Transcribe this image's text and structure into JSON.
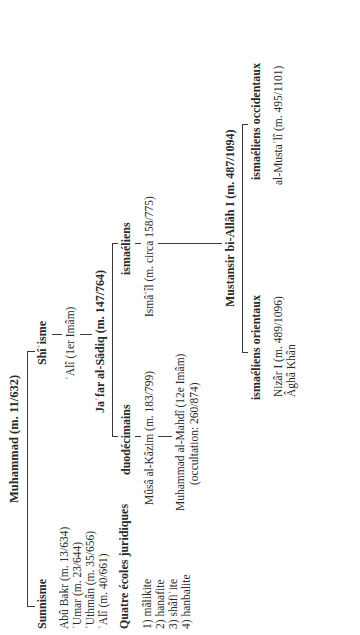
{
  "diagram": {
    "root": "Muhammad (m. 11/632)",
    "sunnisme": {
      "title": "Sunnisme",
      "caliphs": [
        "Abû Bakr (m. 13/634)",
        "ʿUmar (m. 23/644)",
        "ʿUthmân (m. 35/656)",
        "ʿAlî (m. 40/661)"
      ],
      "schools_title": "Quatre écoles juridiques",
      "schools": [
        "1) mâlikite",
        "2) hanafite",
        "3) shâfiʿite",
        "4) hanbalite"
      ]
    },
    "shiisme": {
      "title": "Shîʿisme",
      "ali": "ʿAlî (1er Imâm)",
      "jafar": "Jaʿfar al-Sâdiq (m. 147/764)",
      "duodecimains": {
        "title": "duodécimains",
        "musa": "Mûsâ al-Kâzim (m. 183/799)",
        "mahdi_line1": "Muhammad al-Mahdî (12e Imâm)",
        "mahdi_line2": "(occultation: 260/874)"
      },
      "ismaeliens": {
        "title": "ismaéliens",
        "ismail": "Ismâʿîl (m. circa 158/775)",
        "mustansir": "Mustansir bi-Allâh I (m. 487/1094)",
        "orientaux": {
          "title": "ismaéliens orientaux",
          "members": [
            "Nizâr I (m. 489/1096)",
            "Âghâ Khân"
          ]
        },
        "occidentaux": {
          "title": "ismaéliens occidentaux",
          "members": [
            "al-Mustaʿlî (m. 495/1101)"
          ]
        }
      }
    }
  }
}
